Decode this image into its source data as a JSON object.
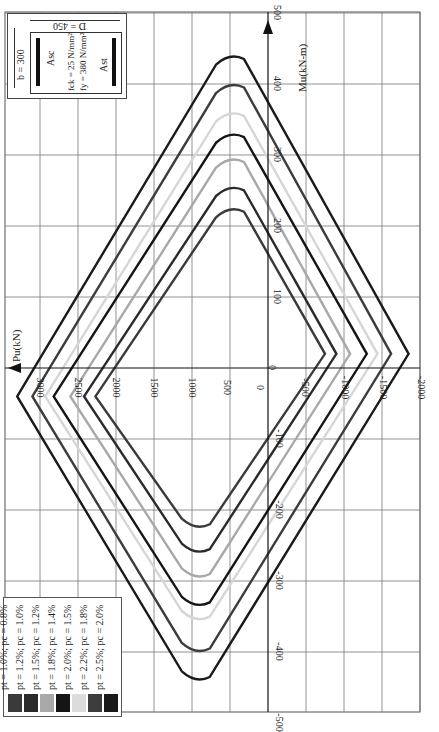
{
  "chart_data": {
    "type": "line",
    "orientation": "rotated: Pu axis horizontal increasing to the left, Mu axis vertical increasing upward",
    "xlabel": "Mu(kN-m)",
    "ylabel": "Pu(kN)",
    "mu_ticks": [
      500,
      400,
      300,
      200,
      100,
      0,
      -100,
      -200,
      -300,
      -400,
      -500
    ],
    "pu_ticks": [
      3000,
      2500,
      2000,
      1500,
      1000,
      500,
      0,
      -500,
      -1000,
      -1500,
      -2000
    ],
    "mu_range": [
      -500,
      500
    ],
    "pu_range": [
      -2000,
      3300
    ],
    "grid": true,
    "legend_position": "bottom-left",
    "series": [
      {
        "name": "pt = 1.0%; pc = 0.8%",
        "color": "#3a3a3a",
        "points": [
          [
            2270,
            -40
          ],
          [
            500,
            230
          ],
          [
            -750,
            20
          ],
          [
            950,
            -230
          ]
        ]
      },
      {
        "name": "pt = 1.2%; pc = 1.0%",
        "color": "#2a2a2a",
        "points": [
          [
            2420,
            -40
          ],
          [
            500,
            260
          ],
          [
            -900,
            20
          ],
          [
            950,
            -265
          ]
        ]
      },
      {
        "name": "pt = 1.5%; pc = 1.2%",
        "color": "#a8a8a8",
        "points": [
          [
            2600,
            -40
          ],
          [
            500,
            300
          ],
          [
            -1080,
            20
          ],
          [
            950,
            -300
          ]
        ]
      },
      {
        "name": "pt = 1.8%; pc = 1.4%",
        "color": "#151515",
        "points": [
          [
            2820,
            -40
          ],
          [
            500,
            335
          ],
          [
            -1300,
            20
          ],
          [
            950,
            -340
          ]
        ]
      },
      {
        "name": "pt = 2.0%; pc = 1.5%",
        "color": "#d6d6d6",
        "points": [
          [
            2930,
            -40
          ],
          [
            500,
            365
          ],
          [
            -1440,
            20
          ],
          [
            950,
            -360
          ]
        ]
      },
      {
        "name": "pt = 2.2%; pc = 1.8%",
        "color": "#3c3c3c",
        "points": [
          [
            3100,
            -40
          ],
          [
            500,
            405
          ],
          [
            -1620,
            20
          ],
          [
            950,
            -405
          ]
        ]
      },
      {
        "name": "pt = 2.5%; pc = 2.0%",
        "color": "#1a1a1a",
        "points": [
          [
            3300,
            -40
          ],
          [
            500,
            445
          ],
          [
            -1850,
            20
          ],
          [
            950,
            -445
          ]
        ]
      }
    ]
  },
  "axes": {
    "pu_label": "Pu(kN)",
    "mu_label": "Mu(kN-m)"
  },
  "legend": [
    {
      "label": "pt = 1.0%; pc = 0.8%",
      "color": "#3a3a3a"
    },
    {
      "label": "pt = 1.2%; pc = 1.0%",
      "color": "#2a2a2a"
    },
    {
      "label": "pt = 1.5%; pc = 1.2%",
      "color": "#a8a8a8"
    },
    {
      "label": "pt = 1.8%; pc = 1.4%",
      "color": "#151515"
    },
    {
      "label": "pt = 2.0%; pc = 1.5%",
      "color": "#dcdcdc"
    },
    {
      "label": "pt = 2.2%; pc = 1.8%",
      "color": "#3c3c3c"
    },
    {
      "label": "pt = 2.5%; pc = 2.0%",
      "color": "#1a1a1a"
    }
  ],
  "inset": {
    "width_label": "b = 300",
    "depth_label": "D = 450",
    "fck": "fck = 25 N/mm²",
    "fy": "fy = 380 N/mm²",
    "asc": "Asc",
    "ast": "Ast"
  }
}
